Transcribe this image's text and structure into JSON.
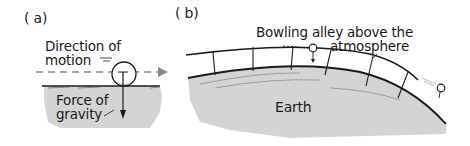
{
  "panels": [
    {
      "label": "( a)",
      "annotations": {
        "direction_line1": "Direction of",
        "direction_line2": "motion",
        "force_line1": "Force of",
        "force_line2": "gravity"
      }
    },
    {
      "label": "( b)",
      "annotations": {
        "alley_line1": "Bowling alley above the",
        "alley_line2": "atmosphere",
        "earth": "Earth"
      }
    }
  ],
  "colors": {
    "ground_fill": "#d4d4d4",
    "line": "#1a1a1a",
    "dashed_arrow": "#8a8a8a",
    "background": "#ffffff"
  }
}
